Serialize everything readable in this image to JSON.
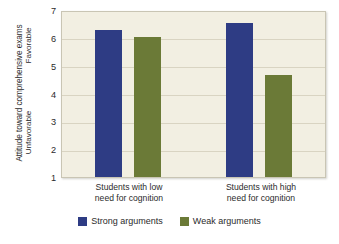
{
  "chart_data": {
    "type": "bar",
    "title": "",
    "xlabel": "",
    "ylabel": "Attitude toward comprehensive exams",
    "ylim": [
      1,
      7
    ],
    "yticks": [
      1,
      2,
      3,
      4,
      5,
      6,
      7
    ],
    "grid": true,
    "legend_position": "bottom-center",
    "y_axis_anchor_high": "Favorable",
    "y_axis_anchor_low": "Unfavorable",
    "categories": [
      "Students with low need for cognition",
      "Students with high need for cognition"
    ],
    "category_lines": [
      [
        "Students with low",
        "need for cognition"
      ],
      [
        "Students with high",
        "need for cognition"
      ]
    ],
    "series": [
      {
        "name": "Strong arguments",
        "color": "#2e3c84",
        "values": [
          6.35,
          6.6
        ]
      },
      {
        "name": "Weak arguments",
        "color": "#6b7a37",
        "values": [
          6.1,
          4.7
        ]
      }
    ]
  },
  "colors": {
    "strong": "#2e3c84",
    "weak": "#6b7a37",
    "plot_background": "#f2efe2",
    "gridline": "#d9d4c2",
    "frame": "#c9c5b4",
    "text": "#2b2b2b"
  },
  "axis": {
    "y_title": "Attitude toward comprehensive exams",
    "anchor_favorable": "Favorable",
    "anchor_unfavorable": "Unfavorable",
    "ticks": {
      "t7": "7",
      "t6": "6",
      "t5": "5",
      "t4": "4",
      "t3": "3",
      "t2": "2",
      "t1": "1"
    }
  },
  "categories": {
    "low": {
      "line1": "Students with low",
      "line2": "need for cognition"
    },
    "high": {
      "line1": "Students with high",
      "line2": "need for cognition"
    }
  },
  "legend": {
    "strong_label": "Strong arguments",
    "weak_label": "Weak arguments"
  },
  "caption": {
    "text": ""
  }
}
